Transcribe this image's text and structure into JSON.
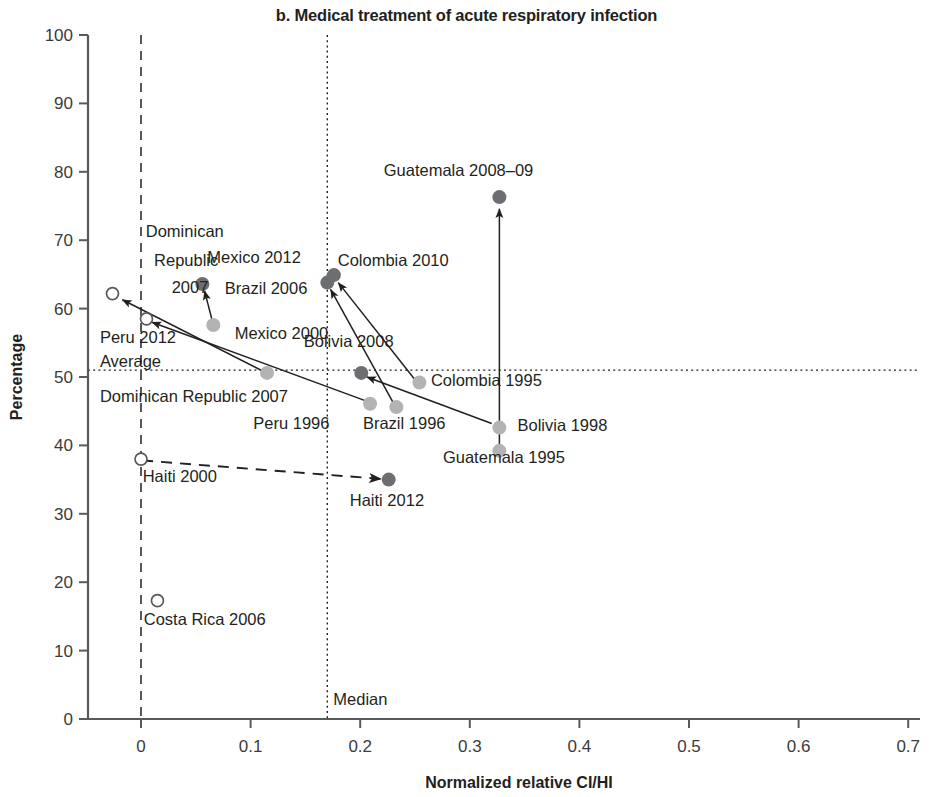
{
  "chart_data": {
    "type": "scatter",
    "title": "b. Medical treatment of acute respiratory infection",
    "xlabel": "Normalized relative CI/HI",
    "ylabel": "Percentage",
    "xlim": [
      -0.05,
      0.7
    ],
    "ylim": [
      0,
      100
    ],
    "xticks": [
      "0",
      "0.1",
      "0.2",
      "0.3",
      "0.4",
      "0.5",
      "0.6",
      "0.7"
    ],
    "xtick_values": [
      0,
      0.1,
      0.2,
      0.3,
      0.4,
      0.5,
      0.6,
      0.7
    ],
    "yticks": [
      "0",
      "10",
      "20",
      "30",
      "40",
      "50",
      "60",
      "70",
      "80",
      "90",
      "100"
    ],
    "ytick_values": [
      0,
      10,
      20,
      30,
      40,
      50,
      60,
      70,
      80,
      90,
      100
    ],
    "grid": false,
    "legend": "none",
    "reference_lines": [
      {
        "name": "average",
        "label": "Average",
        "orientation": "horizontal",
        "value": 51,
        "style": "dotted"
      },
      {
        "name": "median",
        "label": "Median",
        "orientation": "vertical",
        "value": 0.17,
        "style": "dotted"
      },
      {
        "name": "zero-vertical",
        "label": "",
        "orientation": "vertical",
        "value": 0.0,
        "style": "dashed"
      },
      {
        "name": "zero-horizontal",
        "label": "",
        "orientation": "horizontal",
        "value": 0.0,
        "style": "dashed"
      }
    ],
    "points": [
      {
        "label": "Dominican Republic 2007",
        "x": -0.026,
        "y": 62.2,
        "marker": "open",
        "label_dx": 0,
        "label_dy": 0
      },
      {
        "label": "Peru 2012",
        "x": 0.005,
        "y": 58.5,
        "marker": "open"
      },
      {
        "label": "Haiti 2000",
        "x": 0.0,
        "y": 38.0,
        "marker": "open"
      },
      {
        "label": "Costa Rica 2006",
        "x": 0.015,
        "y": 17.3,
        "marker": "open"
      },
      {
        "label": "Mexico 2012",
        "x": 0.056,
        "y": 63.6,
        "marker": "dark"
      },
      {
        "label": "Mexico 2000",
        "x": 0.066,
        "y": 57.6,
        "marker": "light"
      },
      {
        "label": "Dominican Republic 2007 (endpoint)",
        "x": 0.115,
        "y": 50.6,
        "marker": "light"
      },
      {
        "label": "Brazil 2006",
        "x": 0.17,
        "y": 63.8,
        "marker": "dark"
      },
      {
        "label": "Colombia 2010",
        "x": 0.176,
        "y": 64.9,
        "marker": "dark"
      },
      {
        "label": "Bolivia 2008",
        "x": 0.201,
        "y": 50.6,
        "marker": "dark"
      },
      {
        "label": "Peru 1996",
        "x": 0.209,
        "y": 46.1,
        "marker": "light"
      },
      {
        "label": "Brazil 1996",
        "x": 0.233,
        "y": 45.6,
        "marker": "light"
      },
      {
        "label": "Haiti 2012",
        "x": 0.226,
        "y": 35.0,
        "marker": "dark"
      },
      {
        "label": "Colombia 1995",
        "x": 0.254,
        "y": 49.2,
        "marker": "light"
      },
      {
        "label": "Guatemala 2008-09",
        "x": 0.327,
        "y": 76.3,
        "marker": "dark"
      },
      {
        "label": "Bolivia 1998",
        "x": 0.327,
        "y": 42.6,
        "marker": "light"
      },
      {
        "label": "Guatemala 1995",
        "x": 0.327,
        "y": 39.2,
        "marker": "light"
      }
    ],
    "arrows": [
      {
        "name": "mexico-2000-to-2012",
        "x1": 0.066,
        "y1": 57.6,
        "x2": 0.058,
        "y2": 62.6,
        "style": "solid"
      },
      {
        "name": "dominican-republic-arrow",
        "x1": 0.118,
        "y1": 50.3,
        "x2": -0.017,
        "y2": 61.3,
        "style": "solid"
      },
      {
        "name": "peru-1996-to-2012",
        "x1": 0.207,
        "y1": 46.4,
        "x2": 0.01,
        "y2": 58.0,
        "style": "solid"
      },
      {
        "name": "brazil-1996-to-2006",
        "x1": 0.231,
        "y1": 46.0,
        "x2": 0.173,
        "y2": 62.8,
        "style": "solid"
      },
      {
        "name": "colombia-1995-to-2010",
        "x1": 0.25,
        "y1": 49.6,
        "x2": 0.18,
        "y2": 63.8,
        "style": "solid"
      },
      {
        "name": "bolivia-1998-to-2008",
        "x1": 0.32,
        "y1": 43.2,
        "x2": 0.206,
        "y2": 50.0,
        "style": "solid"
      },
      {
        "name": "guatemala-1995-to-2008",
        "x1": 0.327,
        "y1": 39.8,
        "x2": 0.327,
        "y2": 74.6,
        "style": "solid"
      },
      {
        "name": "haiti-2000-to-2012",
        "x1": 0.001,
        "y1": 37.8,
        "x2": 0.219,
        "y2": 35.1,
        "style": "dashed"
      }
    ],
    "annotations": [
      {
        "name": "label-dominican-republic-2007-left",
        "text": "Dominican",
        "x": 0.0755,
        "y": 70.4,
        "anchor": "end"
      },
      {
        "name": "label-dominican-republic-2007-left2",
        "text": "Republic",
        "x": 0.0705,
        "y": 66.3,
        "anchor": "end"
      },
      {
        "name": "label-dominican-republic-2007-left3",
        "text": "2007",
        "x": 0.0615,
        "y": 62.3,
        "anchor": "end"
      },
      {
        "name": "label-mexico-2012",
        "text": "Mexico 2012",
        "x": 0.0605,
        "y": 66.6,
        "anchor": "start"
      },
      {
        "name": "label-colombia-2010",
        "text": "Colombia 2010",
        "x": 0.1795,
        "y": 66.3,
        "anchor": "start"
      },
      {
        "name": "label-brazil-2006",
        "text": "Brazil 2006",
        "x": 0.0765,
        "y": 62.2,
        "anchor": "start"
      },
      {
        "name": "label-mexico-2000",
        "text": "Mexico 2000",
        "x": 0.0855,
        "y": 55.6,
        "anchor": "start"
      },
      {
        "name": "label-peru-2012",
        "text": "Peru 2012",
        "x": -0.0375,
        "y": 55.0,
        "anchor": "start"
      },
      {
        "name": "label-average",
        "text": "Average",
        "x": -0.0375,
        "y": 51.5,
        "anchor": "start"
      },
      {
        "name": "label-bolivia-2008",
        "text": "Bolivia 2008",
        "x": 0.1485,
        "y": 54.4,
        "anchor": "start"
      },
      {
        "name": "label-colombia-1995",
        "text": "Colombia 1995",
        "x": 0.2645,
        "y": 48.7,
        "anchor": "start"
      },
      {
        "name": "label-dominican-republic-2007-low",
        "text": "Dominican Republic 2007",
        "x": -0.0375,
        "y": 46.4,
        "anchor": "start"
      },
      {
        "name": "label-peru-1996",
        "text": "Peru 1996",
        "x": 0.1025,
        "y": 42.4,
        "anchor": "start"
      },
      {
        "name": "label-brazil-1996",
        "text": "Brazil 1996",
        "x": 0.2025,
        "y": 42.4,
        "anchor": "start"
      },
      {
        "name": "label-bolivia-1998",
        "text": "Bolivia 1998",
        "x": 0.3435,
        "y": 42.1,
        "anchor": "start"
      },
      {
        "name": "label-guatemala-1995",
        "text": "Guatemala 1995",
        "x": 0.2755,
        "y": 37.5,
        "anchor": "start"
      },
      {
        "name": "label-guatemala-2008-09",
        "text": "Guatemala 2008–09",
        "x": 0.2215,
        "y": 79.4,
        "anchor": "start"
      },
      {
        "name": "label-haiti-2000",
        "text": "Haiti 2000",
        "x": 0.0015,
        "y": 34.7,
        "anchor": "start"
      },
      {
        "name": "label-haiti-2012",
        "text": "Haiti 2012",
        "x": 0.1905,
        "y": 31.1,
        "anchor": "start"
      },
      {
        "name": "label-costa-rica-2006",
        "text": "Costa Rica 2006",
        "x": 0.0025,
        "y": 13.8,
        "anchor": "start"
      },
      {
        "name": "label-median",
        "text": "Median",
        "x": 0.1755,
        "y": 2.1,
        "anchor": "start"
      }
    ],
    "colors": {
      "dark_marker": "#6d6e71",
      "light_marker": "#b3b3b3",
      "open_marker_stroke": "#58595b",
      "axis": "#58595b",
      "text": "#231f20",
      "arrow": "#231f20"
    }
  }
}
